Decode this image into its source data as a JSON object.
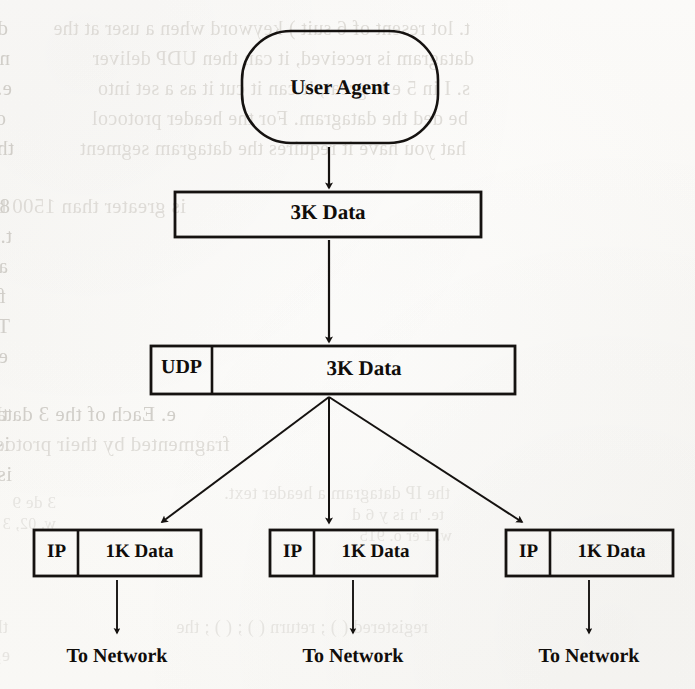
{
  "page": {
    "width": 695,
    "height": 689,
    "background_color": "#fdfcfa",
    "ink_color": "#100d0a",
    "ghost_text_color": "#c9c6c0",
    "kind": "scanned-textbook-figure"
  },
  "diagram": {
    "type": "flowchart",
    "nodes": {
      "user_agent": {
        "label": "User Agent",
        "shape": "rounded-rectangle"
      },
      "app_data": {
        "label": "3K Data",
        "shape": "rectangle"
      },
      "udp_datagram": {
        "header_label": "UDP",
        "payload_label": "3K Data",
        "shape": "split-rectangle"
      },
      "ip_packets": [
        {
          "header_label": "IP",
          "payload_label": "1K Data",
          "shape": "split-rectangle"
        },
        {
          "header_label": "IP",
          "payload_label": "1K Data",
          "shape": "split-rectangle"
        },
        {
          "header_label": "IP",
          "payload_label": "1K Data",
          "shape": "split-rectangle"
        }
      ]
    },
    "terminals": [
      {
        "label": "To Network"
      },
      {
        "label": "To Network"
      },
      {
        "label": "To Network"
      }
    ],
    "edges": [
      {
        "from": "user_agent",
        "to": "app_data",
        "style": "arrow-down"
      },
      {
        "from": "app_data",
        "to": "udp_datagram",
        "style": "arrow-down"
      },
      {
        "from": "udp_datagram",
        "to": "ip_packet_1",
        "style": "arrow-diagonal-left"
      },
      {
        "from": "udp_datagram",
        "to": "ip_packet_2",
        "style": "arrow-down"
      },
      {
        "from": "udp_datagram",
        "to": "ip_packet_3",
        "style": "arrow-diagonal-right"
      },
      {
        "from": "ip_packet_1",
        "to": "to_network_1",
        "style": "arrow-down"
      },
      {
        "from": "ip_packet_2",
        "to": "to_network_2",
        "style": "arrow-down"
      },
      {
        "from": "ip_packet_3",
        "to": "to_network_3",
        "style": "arrow-down"
      }
    ]
  },
  "ghost_text": {
    "note": "faint mirrored show-through text from the reverse side of the scanned page",
    "lines": [
      {
        "text": "d for several of the UDP datagram when a user at the",
        "x": 8,
        "y": 18,
        "size": 21,
        "class": "ghost-line"
      },
      {
        "text": "t. lot resent of 6 suit ) keyword when a user at the",
        "x": 470,
        "y": 18,
        "size": 20,
        "class": "ghost-line g-faint"
      },
      {
        "text": "ntaining the data requested, it contains 11 of the s",
        "x": 10,
        "y": 48,
        "size": 21,
        "class": "ghost-line"
      },
      {
        "text": "datagram is received, it can then UDP deliver",
        "x": 474,
        "y": 48,
        "size": 20,
        "class": "ghost-line g-faint"
      },
      {
        "text": "e. Thus it is grouped as a single set of into messag",
        "x": 12,
        "y": 78,
        "size": 21,
        "class": "ghost-line"
      },
      {
        "text": "s. I in 5 e is great, it can it cut it as a set into",
        "x": 470,
        "y": 78,
        "size": 20,
        "class": "ghost-line g-faint"
      },
      {
        "text": "ocated the datagram. For each message, an IP header, t",
        "x": 6,
        "y": 108,
        "size": 21,
        "class": "ghost-line"
      },
      {
        "text": "be ded the datagram. For the header protocol",
        "x": 468,
        "y": 108,
        "size": 20,
        "class": "ghost-line g-faint"
      },
      {
        "text": "that you have it requires the datagram be used.",
        "x": 14,
        "y": 138,
        "size": 21,
        "class": "ghost-line"
      },
      {
        "text": "hat you have it requires the datagram segment",
        "x": 466,
        "y": 138,
        "size": 20,
        "class": "ghost-line g-faint"
      },
      {
        "text": "is greater than 1500 bytes in length, the UDP",
        "x": 186,
        "y": 196,
        "size": 21,
        "class": "ghost-line g-faint"
      },
      {
        "text": "8 bytes is greater than 1500 in length, these is",
        "x": 10,
        "y": 196,
        "size": 21,
        "class": "ghost-line"
      },
      {
        "text": "t. Enters it is broken into packets by IP.",
        "x": 12,
        "y": 226,
        "size": 21,
        "class": "ghost-line"
      },
      {
        "text": "all the resources of IP and TCP.  Thus it is other",
        "x": 8,
        "y": 256,
        "size": 21,
        "class": "ghost-line"
      },
      {
        "text": "fragments. It is a fact we need by is at practical server",
        "x": 6,
        "y": 286,
        "size": 21,
        "class": "ghost-line"
      },
      {
        "text": "This is a fact. Each part of these parts of the IP",
        "x": 10,
        "y": 316,
        "size": 21,
        "class": "ghost-line"
      },
      {
        "text": "e. Each of these packets becomes an IP packet itself",
        "x": 8,
        "y": 346,
        "size": 21,
        "class": "ghost-line"
      },
      {
        "text": "e. Each of the 3 datagram, but the headers there. The",
        "x": 176,
        "y": 404,
        "size": 21,
        "class": "ghost-line"
      },
      {
        "text": "the IP datagram, 1/n of the packets from. The",
        "x": 8,
        "y": 404,
        "size": 21,
        "class": "ghost-line"
      },
      {
        "text": "is called into fragment. On the receiver can frag",
        "x": 10,
        "y": 434,
        "size": 21,
        "class": "ghost-line"
      },
      {
        "text": "fragmented by their protocol. On the receiver",
        "x": 230,
        "y": 434,
        "size": 21,
        "class": "ghost-line g-faint"
      },
      {
        "text": "is context radius by the IP protocol.",
        "x": 12,
        "y": 464,
        "size": 21,
        "class": "ghost-line"
      },
      {
        "text": "the IP datagram a header text.",
        "x": 450,
        "y": 484,
        "size": 18,
        "class": "ghost-line g-vfaint"
      },
      {
        "text": "3 de 9",
        "x": 56,
        "y": 494,
        "size": 17,
        "class": "ghost-line g-vfaint"
      },
      {
        "text": "te. 'n is y 6 d",
        "x": 444,
        "y": 506,
        "size": 17,
        "class": "ghost-line g-vfaint"
      },
      {
        "text": "w. 02, 3 e er",
        "x": 56,
        "y": 516,
        "size": 16,
        "class": "ghost-line g-vfaint"
      },
      {
        "text": "w. 1 er o. 915",
        "x": 452,
        "y": 528,
        "size": 16,
        "class": "ghost-line g-vfaint"
      },
      {
        "text": "the ip_datagram in a NetPacket->IP_address( )",
        "x": 8,
        "y": 618,
        "size": 18,
        "class": "ghost-line g-vfaint"
      },
      {
        "text": "registered ( ) ; return ( ) ; ( ) ; the",
        "x": 428,
        "y": 618,
        "size": 18,
        "class": "ghost-line g-vfaint"
      },
      {
        "text": "e; if ( ) != EDOM1; ), set up SO HDR, then",
        "x": 10,
        "y": 646,
        "size": 18,
        "class": "ghost-line g-vfaint"
      }
    ]
  }
}
